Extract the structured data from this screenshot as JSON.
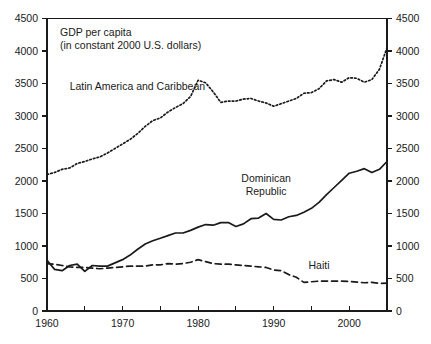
{
  "chart_data": {
    "type": "line",
    "title": "",
    "xlabel": "",
    "ylabel": "",
    "xlim": [
      1960,
      2005
    ],
    "ylim": [
      0,
      4500
    ],
    "grid": false,
    "legend_position": "inline-labels",
    "y_ticks": [
      0,
      500,
      1000,
      1500,
      2000,
      2500,
      3000,
      3500,
      4000,
      4500
    ],
    "y_tick_labels": [
      "0",
      "500",
      "1000",
      "1500",
      "2000",
      "2500",
      "3000",
      "3500",
      "4000",
      "4500"
    ],
    "y_axis_mirrored": true,
    "x_ticks": [
      1960,
      1965,
      1970,
      1975,
      1980,
      1985,
      1990,
      1995,
      2000,
      2005
    ],
    "x_tick_labels_shown": [
      "1960",
      "1970",
      "1980",
      "1990",
      "2000"
    ],
    "x_labeled_ticks": [
      1960,
      1970,
      1980,
      1990,
      2000
    ],
    "annotation_lines": [
      "GDP per capita",
      "(in constant 2000 U.S. dollars)"
    ],
    "series": [
      {
        "name": "Latin America and Caribbean",
        "style": "dotted",
        "label_x": 1963,
        "label_y": 3400,
        "x": [
          1960,
          1961,
          1962,
          1963,
          1964,
          1965,
          1966,
          1967,
          1968,
          1969,
          1970,
          1971,
          1972,
          1973,
          1974,
          1975,
          1976,
          1977,
          1978,
          1979,
          1980,
          1981,
          1982,
          1983,
          1984,
          1985,
          1986,
          1987,
          1988,
          1989,
          1990,
          1991,
          1992,
          1993,
          1994,
          1995,
          1996,
          1997,
          1998,
          1999,
          2000,
          2001,
          2002,
          2003,
          2004,
          2005
        ],
        "values": [
          2100,
          2130,
          2180,
          2200,
          2270,
          2300,
          2340,
          2370,
          2430,
          2500,
          2570,
          2640,
          2730,
          2840,
          2930,
          2970,
          3060,
          3130,
          3190,
          3300,
          3550,
          3510,
          3370,
          3210,
          3230,
          3230,
          3260,
          3270,
          3230,
          3200,
          3150,
          3190,
          3230,
          3270,
          3350,
          3360,
          3420,
          3540,
          3560,
          3520,
          3590,
          3580,
          3520,
          3560,
          3720,
          4050
        ]
      },
      {
        "name": "Dominican Republic",
        "style": "solid",
        "label_x": 1989,
        "label_y": 1990,
        "x": [
          1960,
          1961,
          1962,
          1963,
          1964,
          1965,
          1966,
          1967,
          1968,
          1969,
          1970,
          1971,
          1972,
          1973,
          1974,
          1975,
          1976,
          1977,
          1978,
          1979,
          1980,
          1981,
          1982,
          1983,
          1984,
          1985,
          1986,
          1987,
          1988,
          1989,
          1990,
          1991,
          1992,
          1993,
          1994,
          1995,
          1996,
          1997,
          1998,
          1999,
          2000,
          2001,
          2002,
          2003,
          2004,
          2005
        ],
        "values": [
          780,
          640,
          620,
          700,
          720,
          610,
          700,
          690,
          690,
          740,
          790,
          860,
          950,
          1030,
          1080,
          1120,
          1160,
          1200,
          1200,
          1240,
          1290,
          1330,
          1320,
          1360,
          1360,
          1300,
          1340,
          1420,
          1430,
          1500,
          1410,
          1400,
          1450,
          1470,
          1520,
          1580,
          1670,
          1790,
          1900,
          2010,
          2120,
          2150,
          2190,
          2130,
          2180,
          2300
        ]
      },
      {
        "name": "Haiti",
        "style": "dashed",
        "label_x": 1996,
        "label_y": 640,
        "x": [
          1960,
          1961,
          1962,
          1963,
          1964,
          1965,
          1966,
          1967,
          1968,
          1969,
          1970,
          1971,
          1972,
          1973,
          1974,
          1975,
          1976,
          1977,
          1978,
          1979,
          1980,
          1981,
          1982,
          1983,
          1984,
          1985,
          1986,
          1987,
          1988,
          1989,
          1990,
          1991,
          1992,
          1993,
          1994,
          1995,
          1996,
          1997,
          1998,
          1999,
          2000,
          2001,
          2002,
          2003,
          2004,
          2005
        ],
        "values": [
          730,
          720,
          700,
          680,
          670,
          670,
          660,
          650,
          660,
          670,
          680,
          690,
          690,
          690,
          710,
          710,
          730,
          720,
          730,
          750,
          790,
          760,
          730,
          720,
          720,
          710,
          700,
          690,
          680,
          670,
          630,
          620,
          560,
          520,
          440,
          450,
          460,
          460,
          460,
          460,
          455,
          445,
          435,
          440,
          425,
          430
        ]
      }
    ]
  }
}
